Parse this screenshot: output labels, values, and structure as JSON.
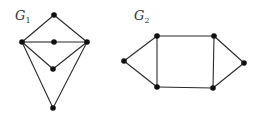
{
  "graphs": [
    {
      "id": "G1",
      "label": "G",
      "subscript": "1",
      "label_pos": [
        15,
        20
      ],
      "nodes": [
        {
          "id": "top",
          "x": 54,
          "y": 15
        },
        {
          "id": "left",
          "x": 22,
          "y": 42
        },
        {
          "id": "center",
          "x": 54,
          "y": 42
        },
        {
          "id": "right",
          "x": 87,
          "y": 42
        },
        {
          "id": "mid_lower",
          "x": 53,
          "y": 69
        },
        {
          "id": "bottom",
          "x": 53,
          "y": 108
        }
      ],
      "edges": [
        [
          "top",
          "left"
        ],
        [
          "top",
          "right"
        ],
        [
          "left",
          "center"
        ],
        [
          "center",
          "right"
        ],
        [
          "left",
          "mid_lower"
        ],
        [
          "right",
          "mid_lower"
        ],
        [
          "left",
          "bottom"
        ],
        [
          "right",
          "bottom"
        ]
      ]
    },
    {
      "id": "G2",
      "label": "G",
      "subscript": "2",
      "label_pos": [
        134,
        20
      ],
      "nodes": [
        {
          "id": "left",
          "x": 124,
          "y": 61
        },
        {
          "id": "top_left",
          "x": 157,
          "y": 36
        },
        {
          "id": "top_right",
          "x": 214,
          "y": 36
        },
        {
          "id": "right",
          "x": 244,
          "y": 63
        },
        {
          "id": "bottom_left",
          "x": 157,
          "y": 87
        },
        {
          "id": "bottom_right",
          "x": 213,
          "y": 88
        }
      ],
      "edges": [
        [
          "left",
          "top_left"
        ],
        [
          "left",
          "bottom_left"
        ],
        [
          "top_left",
          "top_right"
        ],
        [
          "bottom_left",
          "bottom_right"
        ],
        [
          "top_left",
          "bottom_left"
        ],
        [
          "top_right",
          "bottom_right"
        ],
        [
          "top_right",
          "right"
        ],
        [
          "bottom_right",
          "right"
        ]
      ]
    }
  ],
  "style": {
    "edge_color": "#2a2a2a",
    "node_color": "#111111",
    "node_radius": 2.8
  }
}
